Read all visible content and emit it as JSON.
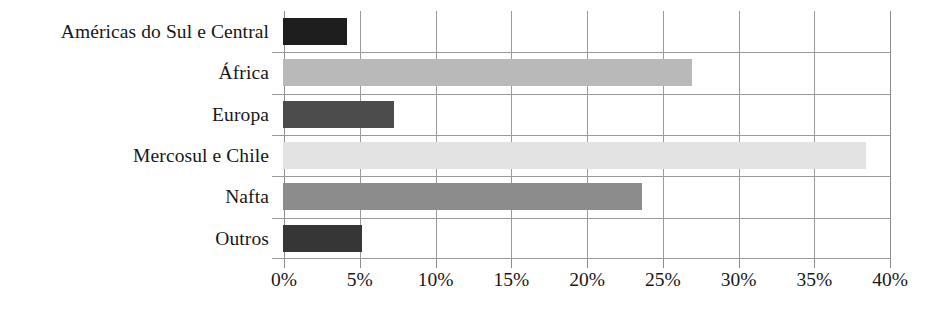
{
  "chart_data": {
    "type": "bar",
    "orientation": "horizontal",
    "title": "",
    "xlabel": "",
    "ylabel": "",
    "categories": [
      "Américas do Sul e Central",
      "África",
      "Europa",
      "Mercosul e Chile",
      "Nafta",
      "Outros"
    ],
    "values": [
      4.2,
      27.0,
      7.3,
      38.5,
      23.7,
      5.2
    ],
    "value_suffix": "%",
    "xlim": [
      0,
      40
    ],
    "xticks": [
      0,
      5,
      10,
      15,
      20,
      25,
      30,
      35,
      40
    ],
    "xtick_labels": [
      "0%",
      "5%",
      "10%",
      "15%",
      "20%",
      "25%",
      "30%",
      "35%",
      "40%"
    ],
    "grid": "vertical-and-row-separators",
    "legend": "none",
    "bar_colors": [
      "#1e1e1e",
      "#b9b9b9",
      "#4c4c4c",
      "#e3e3e3",
      "#8c8c8c",
      "#363636"
    ],
    "axis_color": "#8c8c8c",
    "grid_color": "#9a9a9a",
    "background": "#ffffff"
  }
}
